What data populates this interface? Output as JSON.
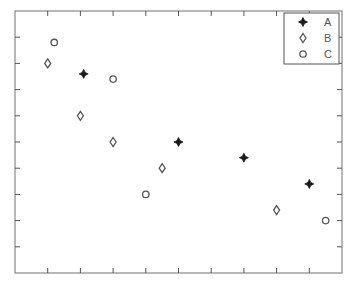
{
  "chart_data": {
    "type": "scatter",
    "title": "",
    "xlabel": "",
    "ylabel": "",
    "xlim": [
      0,
      10
    ],
    "ylim": [
      0,
      10
    ],
    "xticks": [
      1,
      2,
      3,
      4,
      5,
      6,
      7,
      8,
      9
    ],
    "yticks": [
      1,
      2,
      3,
      4,
      5,
      6,
      7,
      8,
      9
    ],
    "tick_labels_shown": false,
    "grid": false,
    "legend_position": "upper right",
    "series": [
      {
        "name": "A",
        "marker": "star-filled",
        "color": "#222222",
        "points": [
          [
            2.1,
            7.6
          ],
          [
            5,
            5.0
          ],
          [
            7,
            4.4
          ],
          [
            9,
            3.4
          ]
        ]
      },
      {
        "name": "B",
        "marker": "diamond-open",
        "color": "#555555",
        "points": [
          [
            1,
            8.0
          ],
          [
            2,
            6.0
          ],
          [
            3,
            5.0
          ],
          [
            4.5,
            4.0
          ],
          [
            8,
            2.4
          ]
        ]
      },
      {
        "name": "C",
        "marker": "circle-open",
        "color": "#555555",
        "points": [
          [
            1.2,
            8.8
          ],
          [
            3,
            7.4
          ],
          [
            4,
            3.0
          ],
          [
            9.5,
            2.0
          ]
        ]
      }
    ]
  },
  "legend": {
    "entries": [
      {
        "label": "A",
        "icon": "star-filled-icon"
      },
      {
        "label": "B",
        "icon": "diamond-open-icon"
      },
      {
        "label": "C",
        "icon": "circle-open-icon"
      }
    ]
  },
  "colors": {
    "axis": "#888888",
    "text": "#555555",
    "background": "#ffffff"
  }
}
